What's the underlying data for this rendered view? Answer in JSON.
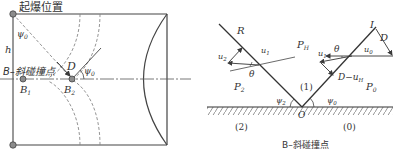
{
  "left_diagram": {
    "title_top": "起爆位置",
    "label_h": "h",
    "label_psi0_top": "ψ",
    "label_psi0_top_sub": "0",
    "label_collision": "B–斜碰撞点",
    "label_B1": "B",
    "label_B1_sub": "1",
    "label_B2": "B",
    "label_B2_sub": "2",
    "label_D": "D",
    "label_psi0_right": "ψ",
    "label_psi0_right_sub": "0"
  },
  "right_diagram": {
    "label_R": "R",
    "label_I": "I",
    "label_D": "D",
    "label_u2": "u",
    "label_u2_sub": "2",
    "label_u1_left": "u",
    "label_u1_left_sub": "1",
    "label_theta_left": "θ",
    "label_PH": "P",
    "label_PH_sub": "H",
    "label_u1_right": "u",
    "label_u1_right_sub": "1",
    "label_theta_right": "θ",
    "label_u0": "u",
    "label_u0_sub": "0",
    "label_D_minus_uH": "D−u",
    "label_D_minus_uH_sub": "H",
    "label_P2": "P",
    "label_P2_sub": "2",
    "label_region1": "(1)",
    "label_P0": "P",
    "label_P0_sub": "0",
    "label_psi2": "ψ",
    "label_psi2_sub": "2",
    "label_psi0": "ψ",
    "label_psi0_sub": "0",
    "label_O": "O",
    "label_region2": "(2)",
    "label_region0": "(0)",
    "caption": "B–斜碰撞点"
  },
  "colors": {
    "line": "#3a3a3a",
    "dashed": "#8a8a8a",
    "node_fill": "#8c8c8c"
  }
}
